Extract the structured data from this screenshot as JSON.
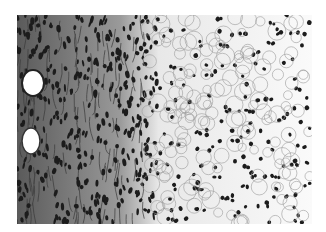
{
  "image": {
    "description": "Grayscale histology micrograph: dense fibrous spindle-cell stroma on the left with two round vessels, transitioning to pale vacuolated tissue with scattered dark nuclei on the right",
    "colors": {
      "background": "#ffffff",
      "dark_nuclei": "#1a1a1a",
      "stroma": "#6e6e6e",
      "pale_tissue": "#f4f4f4"
    }
  }
}
